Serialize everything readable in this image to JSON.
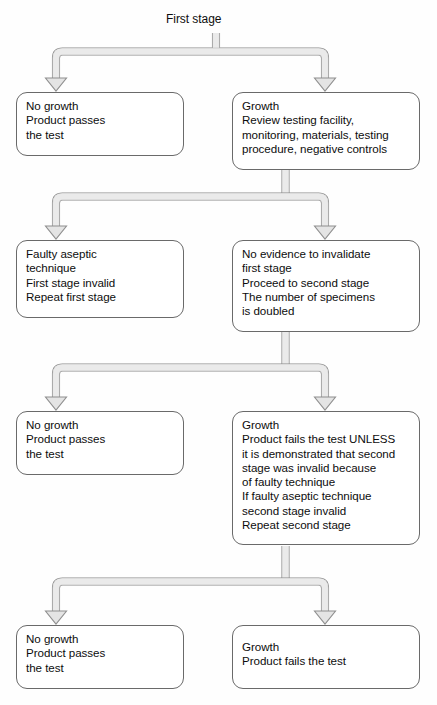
{
  "diagram": {
    "title_label": "First stage",
    "colors": {
      "box_border": "#6a6a6a",
      "box_fill": "#ffffff",
      "connector_outline": "#8a8a8a",
      "connector_fill": "#e3e3e3",
      "text": "#0d0d0d",
      "background": "#fefefe"
    }
  },
  "nodes": [
    {
      "id": "first-stage-no-growth",
      "name": "no-growth-first-stage",
      "lines": [
        "No growth",
        "Product passes",
        "the test"
      ]
    },
    {
      "id": "first-stage-growth",
      "name": "growth-review-first-stage",
      "lines": [
        "Growth",
        "Review testing facility,",
        "monitoring, materials, testing",
        "procedure, negative controls"
      ]
    },
    {
      "id": "faulty-aseptic-technique",
      "name": "faulty-aseptic-technique",
      "lines": [
        "Faulty aseptic",
        "technique",
        "First stage invalid",
        "Repeat first stage"
      ]
    },
    {
      "id": "no-evidence-invalidate",
      "name": "no-evidence-proceed-second-stage",
      "lines": [
        "No evidence to invalidate",
        "first stage",
        "Proceed to second stage",
        "The number of specimens",
        "is doubled"
      ]
    },
    {
      "id": "second-stage-no-growth",
      "name": "no-growth-second-stage",
      "lines": [
        "No growth",
        "Product passes",
        "the test"
      ]
    },
    {
      "id": "second-stage-growth",
      "name": "growth-product-fails-unless",
      "lines": [
        "Growth",
        "Product fails the test UNLESS",
        "it is demonstrated that second",
        "stage was invalid because",
        "of faulty technique",
        "If faulty aseptic technique",
        "second stage invalid",
        "Repeat second stage"
      ]
    },
    {
      "id": "final-no-growth",
      "name": "no-growth-final",
      "lines": [
        "No growth",
        "Product passes",
        "the test"
      ]
    },
    {
      "id": "final-growth",
      "name": "growth-product-fails-final",
      "lines": [
        "Growth",
        "Product fails the test"
      ]
    }
  ]
}
